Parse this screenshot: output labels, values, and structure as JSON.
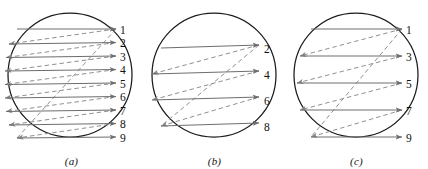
{
  "figure": {
    "type": "diagram",
    "panels": [
      {
        "caption": "(a)",
        "name": "progressive-scan",
        "circle": {
          "cx": 70,
          "cy": 75,
          "r": 62
        },
        "line_labels": [
          "1",
          "2",
          "3",
          "4",
          "5",
          "6",
          "7",
          "8",
          "9"
        ],
        "label_x": 120,
        "label_ys": [
          31,
          44.5,
          58,
          71.5,
          85,
          98.5,
          112,
          125.5,
          139
        ],
        "trace_left_x": [
          17,
          9,
          6,
          5,
          5,
          5,
          6,
          9,
          17
        ],
        "trace_right_x": [
          116,
          116,
          116,
          116,
          116,
          116,
          116,
          116,
          116
        ],
        "trace_y_left": [
          29,
          44,
          57.5,
          71,
          84.5,
          98,
          111.5,
          125,
          138
        ],
        "trace_y_right": [
          29,
          42.5,
          56,
          69.5,
          83,
          96.5,
          110,
          123.5,
          137
        ],
        "retrace_pairs": [
          [
            0,
            1
          ],
          [
            1,
            2
          ],
          [
            2,
            3
          ],
          [
            3,
            4
          ],
          [
            4,
            5
          ],
          [
            5,
            6
          ],
          [
            6,
            7
          ],
          [
            7,
            8
          ]
        ],
        "vertical_retrace": {
          "x1": 116,
          "y1": 29,
          "x2": 17,
          "y2": 138
        }
      },
      {
        "caption": "(b)",
        "name": "even-field-scan",
        "circle": {
          "cx": 214,
          "cy": 75,
          "r": 62
        },
        "line_labels": [
          "2",
          "4",
          "6",
          "8"
        ],
        "label_x": 264,
        "label_ys": [
          50,
          76,
          102,
          128
        ],
        "trace_left_x": [
          161,
          152,
          152,
          161
        ],
        "trace_right_x": [
          259,
          259,
          259,
          259
        ],
        "trace_y_left": [
          48,
          74,
          100,
          126
        ],
        "trace_y_right": [
          45,
          71,
          97,
          123
        ],
        "retrace_pairs": [
          [
            0,
            1
          ],
          [
            1,
            2
          ],
          [
            2,
            3
          ]
        ],
        "vertical_retrace": {
          "x1": 259,
          "y1": 45,
          "x2": 161,
          "y2": 126
        }
      },
      {
        "caption": "(c)",
        "name": "odd-field-scan",
        "circle": {
          "cx": 356,
          "cy": 75,
          "r": 62
        },
        "line_labels": [
          "1",
          "3",
          "5",
          "7",
          "9"
        ],
        "label_x": 406,
        "label_ys": [
          31,
          58,
          85,
          112,
          139
        ],
        "trace_left_x": [
          311,
          300,
          297,
          300,
          311
        ],
        "trace_right_x": [
          402,
          402,
          402,
          402,
          402
        ],
        "trace_y_left": [
          29,
          56,
          83,
          110,
          137
        ],
        "trace_y_right": [
          29,
          56,
          83,
          110,
          137
        ],
        "retrace_pairs": [
          [
            0,
            1
          ],
          [
            1,
            2
          ],
          [
            2,
            3
          ],
          [
            3,
            4
          ]
        ],
        "vertical_retrace": {
          "x1": 402,
          "y1": 29,
          "x2": 311,
          "y2": 137
        }
      }
    ]
  },
  "style": {
    "circle_stroke": "#1a1a1a",
    "trace_stroke": "#6e6e6e",
    "retrace_stroke": "#8a8a8a",
    "label_color": "#101010",
    "background": "#ffffff"
  }
}
